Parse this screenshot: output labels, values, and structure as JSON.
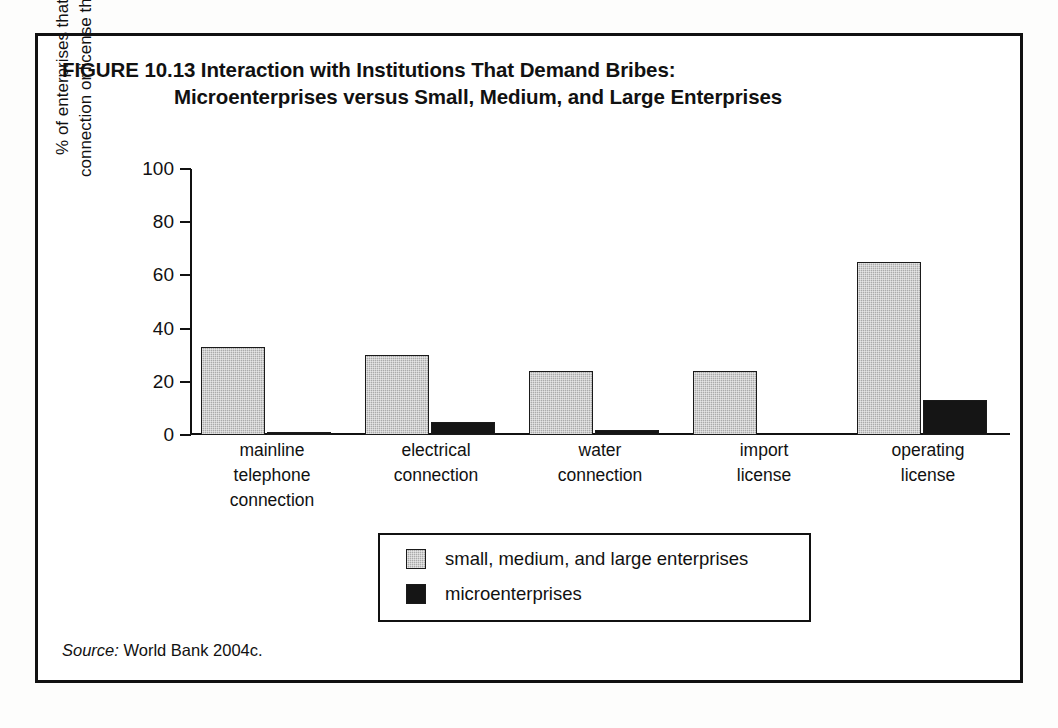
{
  "figure": {
    "label": "FIGURE 10.13",
    "title_line_1": "FIGURE 10.13  Interaction with Institutions That Demand Bribes:",
    "title_line_2": "Microenterprises versus Small, Medium, and Large Enterprises",
    "source_label": "Source:",
    "source_text": " World Bank 2004c."
  },
  "chart_data": {
    "type": "bar",
    "title": "FIGURE 10.13  Interaction with Institutions That Demand Bribes: Microenterprises versus Small, Medium, and Large Enterprises",
    "xlabel": "",
    "ylabel": "% of enterprises that obtained connection or license through bribes",
    "ylabel_line_1": "% of enterprises that obtained",
    "ylabel_line_2": "connection or license through bribes",
    "ylim": [
      0,
      100
    ],
    "yticks": [
      0,
      20,
      40,
      60,
      80,
      100
    ],
    "ytick_labels": [
      "0",
      "20",
      "40",
      "60",
      "80",
      "100"
    ],
    "grid": false,
    "legend_position": "bottom-center",
    "categories": [
      "mainline telephone connection",
      "electrical connection",
      "water connection",
      "import license",
      "operating license"
    ],
    "category_label_lines": [
      [
        "mainline",
        "telephone",
        "connection"
      ],
      [
        "electrical",
        "connection"
      ],
      [
        "water",
        "connection"
      ],
      [
        "import",
        "license"
      ],
      [
        "operating",
        "license"
      ]
    ],
    "series": [
      {
        "name": "small, medium, and large enterprises",
        "color": "#aaaaaa",
        "values": [
          33,
          30,
          24,
          24,
          65
        ]
      },
      {
        "name": "microenterprises",
        "color": "#151515",
        "values": [
          1,
          5,
          2,
          0,
          13
        ]
      }
    ]
  },
  "colors": {
    "frame": "#111111",
    "series_a": "#aaaaaa",
    "series_b": "#151515",
    "background": "#ffffff",
    "text": "#111111"
  }
}
